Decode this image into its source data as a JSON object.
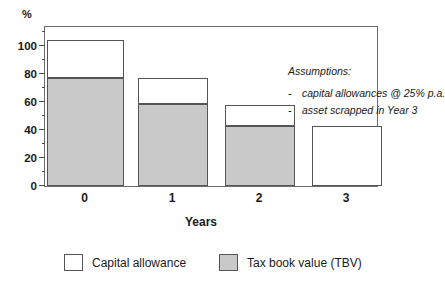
{
  "chart_data": {
    "type": "bar",
    "stacked": true,
    "title": "",
    "xlabel": "Years",
    "ylabel": "%",
    "categories": [
      "0",
      "1",
      "2",
      "3"
    ],
    "ylim": [
      0,
      115
    ],
    "yticks": [
      0,
      20,
      40,
      60,
      80,
      100
    ],
    "yticks_minor": [
      10,
      30,
      50,
      70,
      90,
      110
    ],
    "ytick_labels": [
      "0",
      "20",
      "40",
      "60",
      "80",
      "100"
    ],
    "grid": false,
    "legend_position": "below",
    "series": [
      {
        "name": "Tax book value (TBV)",
        "color": "#c9c9c9",
        "values": [
          77.5,
          58.5,
          43,
          0
        ]
      },
      {
        "name": "Capital allowance",
        "color": "#ffffff",
        "values": [
          26.5,
          19,
          15,
          43
        ]
      }
    ],
    "totals": [
      104,
      77.5,
      58,
      43
    ],
    "annotations": {
      "heading": "Assumptions:",
      "bullets": [
        "capital allowances @ 25% p.a.",
        "asset scrapped in Year 3"
      ],
      "bullet_marker": "-"
    }
  },
  "axes": {
    "unit_label": "%",
    "x_title": "Years",
    "x_tick_labels": [
      "0",
      "1",
      "2",
      "3"
    ],
    "y_tick_labels": [
      "0",
      "20",
      "40",
      "60",
      "80",
      "100"
    ]
  },
  "legend": {
    "items": [
      {
        "label": "Capital allowance",
        "swatch": "white"
      },
      {
        "label": "Tax book value (TBV)",
        "swatch": "gray"
      }
    ]
  },
  "colors": {
    "tbv_fill": "#c9c9c9",
    "ca_fill": "#ffffff",
    "bar_border": "#555555",
    "frame_border": "#6e6e6e",
    "text": "#1a1a1a"
  }
}
